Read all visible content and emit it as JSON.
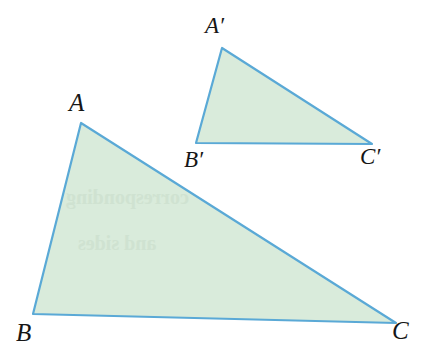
{
  "figure": {
    "background_color": "#ffffff",
    "fill_color": "#d9ebdb",
    "stroke_color": "#5aa9d6",
    "stroke_width": 2.2,
    "label_color": "#161616",
    "canvas": {
      "width": 426,
      "height": 355
    },
    "shapes": [
      {
        "name": "triangle-abc",
        "role": "large-triangle",
        "points": "81,123 33,314 396,323",
        "vertices": [
          {
            "name": "A",
            "x": 81,
            "y": 123
          },
          {
            "name": "B",
            "x": 33,
            "y": 314
          },
          {
            "name": "C",
            "x": 396,
            "y": 323
          }
        ]
      },
      {
        "name": "triangle-a-prime-b-prime-c-prime",
        "role": "small-triangle",
        "points": "222,48 196,143 372,144",
        "vertices": [
          {
            "name": "A'",
            "x": 222,
            "y": 48
          },
          {
            "name": "B'",
            "x": 196,
            "y": 143
          },
          {
            "name": "C'",
            "x": 372,
            "y": 144
          }
        ]
      }
    ],
    "labels": [
      {
        "name": "label-a",
        "text": "A",
        "x": 69,
        "y": 90,
        "size": "big"
      },
      {
        "name": "label-b",
        "text": "B",
        "x": 16,
        "y": 320,
        "size": "big"
      },
      {
        "name": "label-c",
        "text": "C",
        "x": 392,
        "y": 318,
        "size": "big"
      },
      {
        "name": "label-a-prime",
        "text": "A′",
        "x": 205,
        "y": 14,
        "size": "small"
      },
      {
        "name": "label-b-prime",
        "text": "B′",
        "x": 184,
        "y": 148,
        "size": "small"
      },
      {
        "name": "label-c-prime",
        "text": "C′",
        "x": 360,
        "y": 145,
        "size": "small"
      }
    ],
    "bleed_through": [
      {
        "name": "bleed-line-1",
        "text": "corresponding",
        "x": 66,
        "y": 186,
        "size": 20
      },
      {
        "name": "bleed-line-2",
        "text": "and sides",
        "x": 78,
        "y": 232,
        "size": 20
      }
    ]
  }
}
